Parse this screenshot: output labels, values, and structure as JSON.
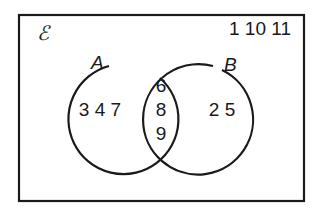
{
  "diagram": {
    "type": "venn",
    "universal_symbol": "ℰ",
    "outside": "1 10 11",
    "sets": [
      {
        "label": "A",
        "only": "3 4 7"
      },
      {
        "label": "B",
        "only": "2 5"
      }
    ],
    "intersection": [
      "6",
      "8",
      "9"
    ]
  }
}
